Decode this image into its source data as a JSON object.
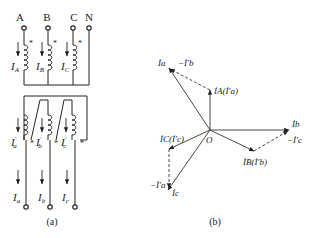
{
  "circuit_a": {
    "caption": "(a)",
    "terminals_top": [
      "A",
      "B",
      "C",
      "N"
    ],
    "primary_currents": [
      {
        "main": "I",
        "sub": "A"
      },
      {
        "main": "I",
        "sub": "B"
      },
      {
        "main": "I",
        "sub": "C"
      }
    ],
    "secondary_currents": [
      {
        "main": "I",
        "sub": "a",
        "prime": "′"
      },
      {
        "main": "I",
        "sub": "b",
        "prime": "′"
      },
      {
        "main": "I",
        "sub": "c",
        "prime": "′"
      }
    ],
    "line_currents": [
      {
        "main": "I",
        "sub": "a"
      },
      {
        "main": "I",
        "sub": "b"
      },
      {
        "main": "I",
        "sub": "c"
      }
    ],
    "polarity_mark": "*"
  },
  "phasor_b": {
    "caption": "(b)",
    "origin_label": "O",
    "labels": {
      "Ia": "İa",
      "neg_Ib_prime": "−İ′b",
      "IA_Ia_prime": "İA(İ′a)",
      "Ib": "İb",
      "neg_Ic_prime": "−İ′c",
      "IB_Ib_prime": "İB(İ′b)",
      "IC_Ic_prime": "İC(İ′c)",
      "neg_Ia_prime": "−İ′a",
      "Ic": "İc"
    }
  }
}
